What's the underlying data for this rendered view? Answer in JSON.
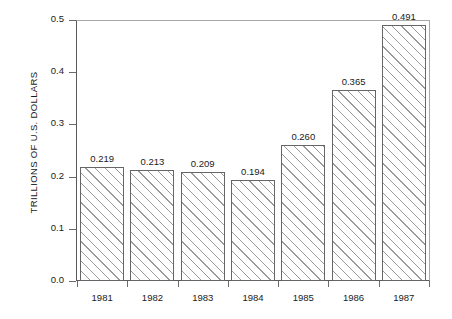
{
  "chart_data": {
    "type": "bar",
    "title": "",
    "subtitle": "",
    "xlabel": "",
    "ylabel": "TRILLIONS OF U.S. DOLLARS",
    "categories": [
      "1981",
      "1982",
      "1983",
      "1984",
      "1985",
      "1986",
      "1987"
    ],
    "values": [
      0.219,
      0.213,
      0.209,
      0.194,
      0.26,
      0.365,
      0.491
    ],
    "data_labels": [
      "0.219",
      "0.213",
      "0.209",
      "0.194",
      "0.260",
      "0.365",
      "0.491"
    ],
    "ylim": [
      0.0,
      0.5
    ],
    "y_ticks": [
      0.0,
      0.1,
      0.2,
      0.3,
      0.4,
      0.5
    ],
    "y_tick_labels": [
      "0.0",
      "0.1",
      "0.2",
      "0.3",
      "0.4",
      "0.5"
    ],
    "grid": false,
    "legend": null,
    "legend_position": "none",
    "bar_fill": "diagonal-hatch",
    "bar_edge_color": "#666666",
    "hatch_color": "#9a9a9a",
    "background_color": "#ffffff",
    "text_color": "#1a1a1a"
  }
}
